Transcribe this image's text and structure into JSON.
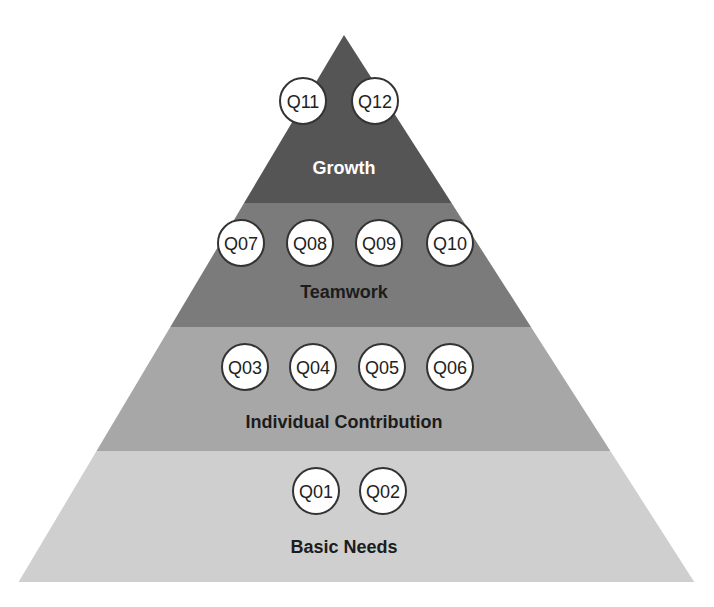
{
  "diagram": {
    "type": "pyramid",
    "apex": [
      344,
      35
    ],
    "base_left": [
      18,
      583
    ],
    "base_right": [
      693,
      580
    ],
    "layers": [
      {
        "name": "Growth",
        "fill": "#555555",
        "label_color": "#ffffff",
        "y_top": 35,
        "y_bottom": 203,
        "label_y": 168,
        "bubble_y": 101,
        "items": [
          {
            "label": "Q11",
            "x": 303
          },
          {
            "label": "Q12",
            "x": 375
          }
        ]
      },
      {
        "name": "Teamwork",
        "fill": "#7b7b7b",
        "label_color": "#1c1c1c",
        "y_top": 203,
        "y_bottom": 327,
        "label_y": 292,
        "bubble_y": 243,
        "items": [
          {
            "label": "Q07",
            "x": 241
          },
          {
            "label": "Q08",
            "x": 310
          },
          {
            "label": "Q09",
            "x": 379
          },
          {
            "label": "Q10",
            "x": 450
          }
        ]
      },
      {
        "name": "Individual Contribution",
        "fill": "#a7a7a7",
        "label_color": "#1c1c1c",
        "y_top": 327,
        "y_bottom": 451,
        "label_y": 422,
        "bubble_y": 367,
        "items": [
          {
            "label": "Q03",
            "x": 245
          },
          {
            "label": "Q04",
            "x": 313
          },
          {
            "label": "Q05",
            "x": 382
          },
          {
            "label": "Q06",
            "x": 450
          }
        ]
      },
      {
        "name": "Basic Needs",
        "fill": "#cfcfcf",
        "label_color": "#1c1c1c",
        "y_top": 451,
        "y_bottom": 582,
        "label_y": 547,
        "bubble_y": 491,
        "items": [
          {
            "label": "Q01",
            "x": 316
          },
          {
            "label": "Q02",
            "x": 383
          }
        ]
      }
    ],
    "bubble": {
      "radius": 23,
      "fill": "#ffffff",
      "stroke": "#333333"
    }
  }
}
